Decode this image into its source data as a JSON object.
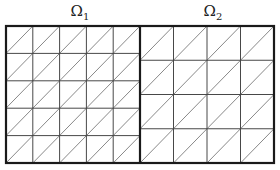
{
  "labels": {
    "left": {
      "symbol": "Ω",
      "sub": "1"
    },
    "right": {
      "symbol": "Ω",
      "sub": "2"
    }
  },
  "domains": [
    {
      "name": "Omega_1",
      "grid": 5,
      "diagonal": "bottom-left to top-right"
    },
    {
      "name": "Omega_2",
      "grid": 4,
      "diagonal": "bottom-left to top-right"
    }
  ],
  "colors": {
    "line": "#333333",
    "border": "#1a1a1a",
    "background": "#ffffff"
  }
}
